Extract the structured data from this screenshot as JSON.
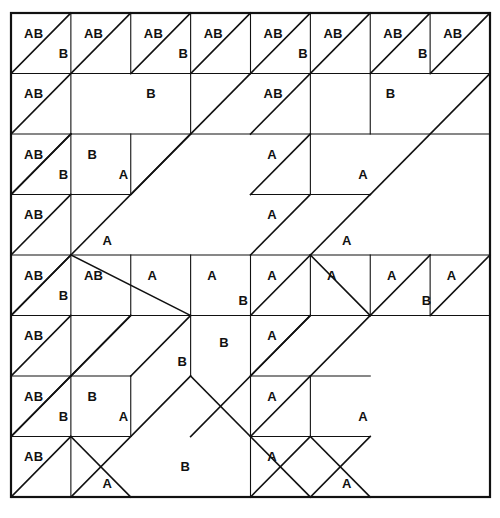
{
  "figure": {
    "kind": "grid-tiling-diagram",
    "title": "",
    "grid": {
      "columns": 8,
      "rows": 8,
      "left": 11,
      "top": 13,
      "right": 490,
      "bottom": 497,
      "cell_width": 59.875,
      "cell_height": 60.5
    },
    "style": {
      "background": "#ffffff",
      "line_color": "#111111",
      "label_color": "#111111",
      "border_width": 2.2,
      "grid_line_width": 1.1,
      "diagonal_width": 1.6,
      "label_font_size": 13
    },
    "labels": {
      "A": "A",
      "B": "B",
      "AB": "AB"
    },
    "segments": [
      {
        "name": "outer-border",
        "type": "rect",
        "x1": 0,
        "y1": 0,
        "x2": 8,
        "y2": 8,
        "w": "border"
      },
      {
        "name": "hline-r1",
        "type": "line",
        "x1": 0,
        "y1": 1,
        "x2": 8,
        "y2": 1,
        "w": "grid"
      },
      {
        "name": "hline-r2",
        "type": "line",
        "x1": 0,
        "y1": 2,
        "x2": 8,
        "y2": 2,
        "w": "grid"
      },
      {
        "name": "hline-r3-left",
        "type": "line",
        "x1": 0,
        "y1": 3,
        "x2": 2,
        "y2": 3,
        "w": "grid"
      },
      {
        "name": "hline-r3-mid",
        "type": "line",
        "x1": 4,
        "y1": 3,
        "x2": 6,
        "y2": 3,
        "w": "grid"
      },
      {
        "name": "hline-r4",
        "type": "line",
        "x1": 0,
        "y1": 4,
        "x2": 8,
        "y2": 4,
        "w": "grid"
      },
      {
        "name": "hline-r5-left",
        "type": "line",
        "x1": 0,
        "y1": 5,
        "x2": 3,
        "y2": 5,
        "w": "grid"
      },
      {
        "name": "hline-r5-midA",
        "type": "line",
        "x1": 3,
        "y1": 5,
        "x2": 4,
        "y2": 5,
        "w": "grid"
      },
      {
        "name": "hline-r5-midB",
        "type": "line",
        "x1": 4,
        "y1": 5,
        "x2": 6,
        "y2": 5,
        "w": "grid"
      },
      {
        "name": "hline-r5-right",
        "type": "line",
        "x1": 6,
        "y1": 5,
        "x2": 8,
        "y2": 5,
        "w": "grid"
      },
      {
        "name": "hline-r6-left",
        "type": "line",
        "x1": 0,
        "y1": 6,
        "x2": 2,
        "y2": 6,
        "w": "grid"
      },
      {
        "name": "hline-r6-mid",
        "type": "line",
        "x1": 4,
        "y1": 6,
        "x2": 6,
        "y2": 6,
        "w": "grid"
      },
      {
        "name": "hline-r7-left",
        "type": "line",
        "x1": 0,
        "y1": 7,
        "x2": 2,
        "y2": 7,
        "w": "grid"
      },
      {
        "name": "hline-r7-mid",
        "type": "line",
        "x1": 4,
        "y1": 7,
        "x2": 6,
        "y2": 7,
        "w": "grid"
      },
      {
        "name": "vline-c1-top",
        "type": "line",
        "x1": 1,
        "y1": 0,
        "x2": 1,
        "y2": 4,
        "w": "grid"
      },
      {
        "name": "vline-c1-bot",
        "type": "line",
        "x1": 1,
        "y1": 4,
        "x2": 1,
        "y2": 8,
        "w": "grid"
      },
      {
        "name": "vline-c2-r0",
        "type": "line",
        "x1": 2,
        "y1": 0,
        "x2": 2,
        "y2": 1,
        "w": "grid"
      },
      {
        "name": "vline-c2-r2",
        "type": "line",
        "x1": 2,
        "y1": 2,
        "x2": 2,
        "y2": 3,
        "w": "grid"
      },
      {
        "name": "vline-c2-r4",
        "type": "line",
        "x1": 2,
        "y1": 4,
        "x2": 2,
        "y2": 5,
        "w": "grid"
      },
      {
        "name": "vline-c2-r6",
        "type": "line",
        "x1": 2,
        "y1": 6,
        "x2": 2,
        "y2": 7,
        "w": "grid"
      },
      {
        "name": "vline-c3-top",
        "type": "line",
        "x1": 3,
        "y1": 0,
        "x2": 3,
        "y2": 2,
        "w": "grid"
      },
      {
        "name": "vline-c3-r4",
        "type": "line",
        "x1": 3,
        "y1": 4,
        "x2": 3,
        "y2": 6,
        "w": "grid"
      },
      {
        "name": "vline-c4-r0",
        "type": "line",
        "x1": 4,
        "y1": 0,
        "x2": 4,
        "y2": 1,
        "w": "grid"
      },
      {
        "name": "vline-c4-r4",
        "type": "line",
        "x1": 4,
        "y1": 4,
        "x2": 4,
        "y2": 5,
        "w": "grid"
      },
      {
        "name": "vline-c4-r5",
        "type": "line",
        "x1": 4,
        "y1": 5,
        "x2": 4,
        "y2": 8,
        "w": "grid"
      },
      {
        "name": "vline-c5-r0",
        "type": "line",
        "x1": 5,
        "y1": 0,
        "x2": 5,
        "y2": 2,
        "w": "grid"
      },
      {
        "name": "vline-c5-r2",
        "type": "line",
        "x1": 5,
        "y1": 2,
        "x2": 5,
        "y2": 3,
        "w": "grid"
      },
      {
        "name": "vline-c5-r4",
        "type": "line",
        "x1": 5,
        "y1": 4,
        "x2": 5,
        "y2": 5,
        "w": "grid"
      },
      {
        "name": "vline-c5-r6",
        "type": "line",
        "x1": 5,
        "y1": 6,
        "x2": 5,
        "y2": 7,
        "w": "grid"
      },
      {
        "name": "vline-c6-r0",
        "type": "line",
        "x1": 6,
        "y1": 0,
        "x2": 6,
        "y2": 1,
        "w": "grid"
      },
      {
        "name": "vline-c6-r1",
        "type": "line",
        "x1": 6,
        "y1": 1,
        "x2": 6,
        "y2": 2,
        "w": "grid"
      },
      {
        "name": "vline-c6-r4",
        "type": "line",
        "x1": 6,
        "y1": 4,
        "x2": 6,
        "y2": 5,
        "w": "grid"
      },
      {
        "name": "vline-c7-r0",
        "type": "line",
        "x1": 7,
        "y1": 0,
        "x2": 7,
        "y2": 1,
        "w": "grid"
      },
      {
        "name": "vline-c7-r4",
        "type": "line",
        "x1": 7,
        "y1": 4,
        "x2": 7,
        "y2": 5,
        "w": "grid"
      }
    ],
    "diagonals": [
      {
        "name": "diag-r0c0",
        "x1": 0,
        "y1": 1,
        "x2": 1,
        "y2": 0
      },
      {
        "name": "diag-r0c1-long",
        "x1": 0,
        "y1": 2,
        "x2": 2,
        "y2": 0
      },
      {
        "name": "diag-r0c2",
        "x1": 2,
        "y1": 1,
        "x2": 3,
        "y2": 0
      },
      {
        "name": "diag-r0c3-long",
        "x1": 2,
        "y1": 3,
        "x2": 4,
        "y2": 1
      },
      {
        "name": "diag-r0c3-upper",
        "x1": 3,
        "y1": 1,
        "x2": 4,
        "y2": 0
      },
      {
        "name": "diag-r0c4",
        "x1": 4,
        "y1": 1,
        "x2": 5,
        "y2": 0
      },
      {
        "name": "diag-r0c5-long",
        "x1": 4,
        "y1": 2,
        "x2": 6,
        "y2": 0
      },
      {
        "name": "diag-r0c6",
        "x1": 6,
        "y1": 1,
        "x2": 7,
        "y2": 0
      },
      {
        "name": "diag-r0c7-long",
        "x1": 6,
        "y1": 3,
        "x2": 8,
        "y2": 1
      },
      {
        "name": "diag-r0c7-upper",
        "x1": 7,
        "y1": 1,
        "x2": 8,
        "y2": 0
      },
      {
        "name": "diag-r1c0",
        "x1": 0,
        "y1": 3,
        "x2": 1,
        "y2": 2
      },
      {
        "name": "diag-r1c4",
        "x1": 4,
        "y1": 3,
        "x2": 5,
        "y2": 2
      },
      {
        "name": "diag-r2c0",
        "x1": 0,
        "y1": 3,
        "x2": 1,
        "y2": 2
      },
      {
        "name": "diag-r2c0b",
        "x1": 0,
        "y1": 4,
        "x2": 1,
        "y2": 3
      },
      {
        "name": "diag-r2c1",
        "x1": 1,
        "y1": 4,
        "x2": 3,
        "y2": 2
      },
      {
        "name": "diag-r2c4",
        "x1": 4,
        "y1": 4,
        "x2": 5,
        "y2": 3
      },
      {
        "name": "diag-r2c5",
        "x1": 5,
        "y1": 4,
        "x2": 6,
        "y2": 3
      },
      {
        "name": "diag-r3c0",
        "x1": 0,
        "y1": 5,
        "x2": 1,
        "y2": 4
      },
      {
        "name": "diag-r3c1-down",
        "x1": 1,
        "y1": 4,
        "x2": 3,
        "y2": 5
      },
      {
        "name": "diag-r3c4",
        "x1": 4,
        "y1": 5,
        "x2": 5,
        "y2": 4
      },
      {
        "name": "diag-r3c5-down",
        "x1": 5,
        "y1": 4,
        "x2": 6,
        "y2": 5
      },
      {
        "name": "diag-r4c0",
        "x1": 0,
        "y1": 5,
        "x2": 1,
        "y2": 4
      },
      {
        "name": "diag-r4c0b",
        "x1": 0,
        "y1": 6,
        "x2": 1,
        "y2": 5
      },
      {
        "name": "diag-r4c1",
        "x1": 1,
        "y1": 6,
        "x2": 2,
        "y2": 5
      },
      {
        "name": "diag-r4c2",
        "x1": 2,
        "y1": 6,
        "x2": 3,
        "y2": 5
      },
      {
        "name": "diag-r4c3",
        "x1": 3,
        "y1": 7,
        "x2": 5,
        "y2": 5
      },
      {
        "name": "diag-r4c4",
        "x1": 4,
        "y1": 6,
        "x2": 5,
        "y2": 5
      },
      {
        "name": "diag-r4c5",
        "x1": 5,
        "y1": 6,
        "x2": 6,
        "y2": 5
      },
      {
        "name": "diag-r4c6",
        "x1": 6,
        "y1": 5,
        "x2": 7,
        "y2": 4
      },
      {
        "name": "diag-r4c7",
        "x1": 7,
        "y1": 5,
        "x2": 8,
        "y2": 4
      },
      {
        "name": "diag-r5c0",
        "x1": 0,
        "y1": 7,
        "x2": 2,
        "y2": 5
      },
      {
        "name": "diag-r5c4",
        "x1": 4,
        "y1": 7,
        "x2": 5,
        "y2": 6
      },
      {
        "name": "diag-r6c0",
        "x1": 0,
        "y1": 7,
        "x2": 1,
        "y2": 6
      },
      {
        "name": "diag-r6c0b",
        "x1": 0,
        "y1": 8,
        "x2": 1,
        "y2": 7
      },
      {
        "name": "diag-r6c1",
        "x1": 1,
        "y1": 8,
        "x2": 3,
        "y2": 6
      },
      {
        "name": "diag-r6c4",
        "x1": 4,
        "y1": 8,
        "x2": 5,
        "y2": 7
      },
      {
        "name": "diag-r6c5",
        "x1": 5,
        "y1": 8,
        "x2": 6,
        "y2": 7
      },
      {
        "name": "diag-r7c1-down",
        "x1": 1,
        "y1": 7,
        "x2": 2,
        "y2": 8
      },
      {
        "name": "diag-r7c3-down",
        "x1": 3,
        "y1": 6,
        "x2": 5,
        "y2": 8
      },
      {
        "name": "diag-r7c5-down",
        "x1": 5,
        "y1": 7,
        "x2": 6,
        "y2": 8
      }
    ],
    "cell_labels": [
      {
        "name": "label-r1c1-ab",
        "text": "AB",
        "x": 0.22,
        "y": 0.18
      },
      {
        "name": "label-r1c1-b",
        "text": "B",
        "x": 0.72,
        "y": 0.52
      },
      {
        "name": "label-r1c2-ab",
        "text": "AB",
        "x": 1.22,
        "y": 0.18
      },
      {
        "name": "label-r1c3-ab",
        "text": "AB",
        "x": 2.22,
        "y": 0.18
      },
      {
        "name": "label-r1c3-b",
        "text": "B",
        "x": 2.72,
        "y": 0.52
      },
      {
        "name": "label-r1c4-ab",
        "text": "AB",
        "x": 3.22,
        "y": 0.18
      },
      {
        "name": "label-r1c5-ab",
        "text": "AB",
        "x": 4.22,
        "y": 0.18
      },
      {
        "name": "label-r1c5-b",
        "text": "B",
        "x": 4.72,
        "y": 0.52
      },
      {
        "name": "label-r1c6-ab",
        "text": "AB",
        "x": 5.22,
        "y": 0.18
      },
      {
        "name": "label-r1c7-ab",
        "text": "AB",
        "x": 6.22,
        "y": 0.18
      },
      {
        "name": "label-r1c7-b",
        "text": "B",
        "x": 6.72,
        "y": 0.52
      },
      {
        "name": "label-r1c8-ab",
        "text": "AB",
        "x": 7.22,
        "y": 0.18
      },
      {
        "name": "label-r2c1-ab",
        "text": "AB",
        "x": 0.22,
        "y": 1.18
      },
      {
        "name": "label-r2c3-b",
        "text": "B",
        "x": 2.18,
        "y": 1.18
      },
      {
        "name": "label-r2c5-ab",
        "text": "AB",
        "x": 4.22,
        "y": 1.18
      },
      {
        "name": "label-r2c7-b",
        "text": "B",
        "x": 6.18,
        "y": 1.18
      },
      {
        "name": "label-r3c1-ab",
        "text": "AB",
        "x": 0.22,
        "y": 2.18
      },
      {
        "name": "label-r3c1-b",
        "text": "B",
        "x": 0.72,
        "y": 2.52
      },
      {
        "name": "label-r3c2-b",
        "text": "B",
        "x": 1.2,
        "y": 2.18
      },
      {
        "name": "label-r3c2-a",
        "text": "A",
        "x": 1.72,
        "y": 2.52
      },
      {
        "name": "label-r3c5-a",
        "text": "A",
        "x": 4.2,
        "y": 2.18
      },
      {
        "name": "label-r3c6-a",
        "text": "A",
        "x": 5.72,
        "y": 2.52
      },
      {
        "name": "label-r4c1-ab",
        "text": "AB",
        "x": 0.22,
        "y": 3.18
      },
      {
        "name": "label-r4c2-a",
        "text": "A",
        "x": 1.45,
        "y": 3.6
      },
      {
        "name": "label-r4c5-a",
        "text": "A",
        "x": 4.2,
        "y": 3.18
      },
      {
        "name": "label-r4c6-a",
        "text": "A",
        "x": 5.45,
        "y": 3.6
      },
      {
        "name": "label-r5c1-ab",
        "text": "AB",
        "x": 0.22,
        "y": 4.18
      },
      {
        "name": "label-r5c1-b",
        "text": "B",
        "x": 0.72,
        "y": 4.52
      },
      {
        "name": "label-r5c2-ab",
        "text": "AB",
        "x": 1.22,
        "y": 4.18
      },
      {
        "name": "label-r5c3-a",
        "text": "A",
        "x": 2.2,
        "y": 4.18
      },
      {
        "name": "label-r5c4-a",
        "text": "A",
        "x": 3.2,
        "y": 4.18
      },
      {
        "name": "label-r5c4-b",
        "text": "B",
        "x": 3.72,
        "y": 4.6
      },
      {
        "name": "label-r5c5-a",
        "text": "A",
        "x": 4.2,
        "y": 4.18
      },
      {
        "name": "label-r5c6-a",
        "text": "A",
        "x": 5.2,
        "y": 4.18
      },
      {
        "name": "label-r5c7-a",
        "text": "A",
        "x": 6.2,
        "y": 4.18
      },
      {
        "name": "label-r5c8-a",
        "text": "A",
        "x": 7.2,
        "y": 4.18
      },
      {
        "name": "label-r5c8-b",
        "text": "B",
        "x": 6.78,
        "y": 4.6
      },
      {
        "name": "label-r6c1-ab",
        "text": "AB",
        "x": 0.22,
        "y": 5.18
      },
      {
        "name": "label-r6c3-b",
        "text": "B",
        "x": 2.7,
        "y": 5.6
      },
      {
        "name": "label-r6c4-b",
        "text": "B",
        "x": 3.4,
        "y": 5.3
      },
      {
        "name": "label-r6c5-a",
        "text": "A",
        "x": 4.2,
        "y": 5.18
      },
      {
        "name": "label-r7c1-ab",
        "text": "AB",
        "x": 0.22,
        "y": 6.18
      },
      {
        "name": "label-r7c1-b",
        "text": "B",
        "x": 0.72,
        "y": 6.52
      },
      {
        "name": "label-r7c2-b",
        "text": "B",
        "x": 1.2,
        "y": 6.18
      },
      {
        "name": "label-r7c2-a",
        "text": "A",
        "x": 1.72,
        "y": 6.52
      },
      {
        "name": "label-r7c5-a",
        "text": "A",
        "x": 4.2,
        "y": 6.18
      },
      {
        "name": "label-r7c6-a",
        "text": "A",
        "x": 5.72,
        "y": 6.52
      },
      {
        "name": "label-r8c1-ab",
        "text": "AB",
        "x": 0.22,
        "y": 7.18
      },
      {
        "name": "label-r8c2-a",
        "text": "A",
        "x": 1.45,
        "y": 7.62
      },
      {
        "name": "label-r8c3-b",
        "text": "B",
        "x": 2.75,
        "y": 7.35
      },
      {
        "name": "label-r8c5-a",
        "text": "A",
        "x": 4.2,
        "y": 7.18
      },
      {
        "name": "label-r8c6-a",
        "text": "A",
        "x": 5.45,
        "y": 7.62
      }
    ]
  }
}
